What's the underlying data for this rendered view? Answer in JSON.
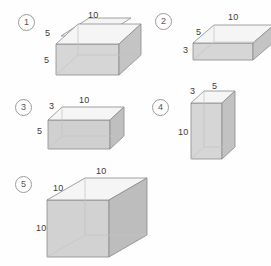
{
  "page": {
    "background_color": "#fefefe",
    "width": 271,
    "height": 266
  },
  "style": {
    "top_face_color": "#f4f4f4",
    "front_face_color": "#d6d6d6",
    "side_face_color": "#c2c2c2",
    "edge_color": "#8a8a8a",
    "hidden_edge_color": "#bfbfbf",
    "label_color": "#3a3a3a",
    "marker_border_color": "#9b9b9b"
  },
  "figures": [
    {
      "marker": "1",
      "marker_glyph": "①",
      "name": "prism-1",
      "dimensions": {
        "width": "10",
        "depth": "5",
        "height": "5"
      },
      "labels": [
        {
          "name": "width-label",
          "text": "10"
        },
        {
          "name": "depth-label",
          "text": "5"
        },
        {
          "name": "height-label",
          "text": "5"
        }
      ]
    },
    {
      "marker": "2",
      "marker_glyph": "②",
      "name": "prism-2",
      "dimensions": {
        "width": "10",
        "depth": "5",
        "height": "3"
      },
      "labels": [
        {
          "name": "width-label",
          "text": "10"
        },
        {
          "name": "depth-label",
          "text": "5"
        },
        {
          "name": "height-label",
          "text": "3"
        }
      ]
    },
    {
      "marker": "3",
      "marker_glyph": "③",
      "name": "prism-3",
      "dimensions": {
        "width": "10",
        "depth": "3",
        "height": "5"
      },
      "labels": [
        {
          "name": "width-label",
          "text": "10"
        },
        {
          "name": "depth-label",
          "text": "3"
        },
        {
          "name": "height-label",
          "text": "5"
        }
      ]
    },
    {
      "marker": "4",
      "marker_glyph": "④",
      "name": "prism-4",
      "dimensions": {
        "width": "5",
        "depth": "3",
        "height": "10"
      },
      "labels": [
        {
          "name": "width-label",
          "text": "5"
        },
        {
          "name": "depth-label",
          "text": "3"
        },
        {
          "name": "height-label",
          "text": "10"
        }
      ]
    },
    {
      "marker": "5",
      "marker_glyph": "⑤",
      "name": "prism-5",
      "dimensions": {
        "width": "10",
        "depth": "10",
        "height": "10"
      },
      "labels": [
        {
          "name": "width-label",
          "text": "10"
        },
        {
          "name": "depth-label",
          "text": "10"
        },
        {
          "name": "height-label",
          "text": "10"
        }
      ]
    }
  ]
}
